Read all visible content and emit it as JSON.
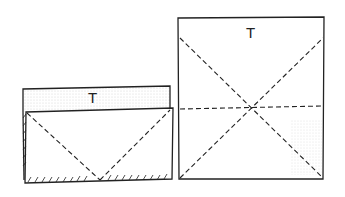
{
  "diagram": {
    "type": "origami-folding-steps",
    "left_figure": {
      "label": "T",
      "description": "Folded rectangle with back layer shaded, diagonal valley folds meeting at bottom center, hatched bottom edge"
    },
    "right_figure": {
      "label": "T",
      "description": "Square with diagonal crease lines crossing and a horizontal dashed crease through center"
    },
    "colors": {
      "line": "#222222",
      "shade": "#bbbbbb",
      "background": "#ffffff"
    }
  }
}
